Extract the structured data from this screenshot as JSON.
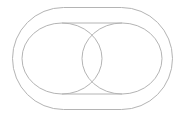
{
  "diagram": {
    "type": "geometric-outline",
    "canvas": {
      "width": 182,
      "height": 118,
      "background": "#ffffff"
    },
    "stroke_color": "#b4b4b4",
    "stroke_width": 1,
    "outer_stadium": {
      "x": 12,
      "y": 7,
      "width": 160,
      "height": 102,
      "corner_radius": 51
    },
    "ellipses": [
      {
        "name": "left",
        "cx": 62,
        "cy": 58.5,
        "rx": 40,
        "ry": 35.5
      },
      {
        "name": "right",
        "cx": 122,
        "cy": 58.5,
        "rx": 40,
        "ry": 35.5
      }
    ],
    "tangent_lines": [
      {
        "name": "top",
        "x1": 62,
        "y1": 23,
        "x2": 122,
        "y2": 23
      },
      {
        "name": "bottom",
        "x1": 62,
        "y1": 94,
        "x2": 122,
        "y2": 94
      }
    ]
  }
}
